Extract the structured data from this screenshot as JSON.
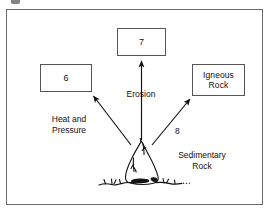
{
  "diagram": {
    "title_visible": false,
    "frame": {
      "border_color": "#6b6b6b"
    },
    "boxes": [
      {
        "id": "box-seven",
        "label": "7"
      },
      {
        "id": "box-six",
        "label": "6"
      },
      {
        "id": "box-igneous",
        "label": "Igneous\nRock"
      }
    ],
    "labels": [
      {
        "id": "erosion",
        "text": "Erosion"
      },
      {
        "id": "heat-and-pressure",
        "text": "Heat and\nPressure"
      },
      {
        "id": "sedimentary-rock",
        "text": "Sedimentary\nRock"
      },
      {
        "id": "arrow-eight",
        "text": "8"
      }
    ],
    "arrows": [
      {
        "id": "arrow-up-erosion",
        "from": "sedimentary-rock",
        "to": "box-seven",
        "label": "Erosion"
      },
      {
        "id": "arrow-upleft-heat",
        "from": "sedimentary-rock",
        "to": "box-six",
        "label": "Heat and Pressure"
      },
      {
        "id": "arrow-upright-eight",
        "from": "sedimentary-rock",
        "to": "box-igneous",
        "label": "8"
      }
    ],
    "illustration": {
      "id": "rock-outcrop",
      "name": "sedimentary-rock-drawing"
    },
    "colors": {
      "ink": "#0f0f0f",
      "box_border": "#555555",
      "frame_border": "#6b6b6b",
      "background": "#ffffff"
    }
  }
}
